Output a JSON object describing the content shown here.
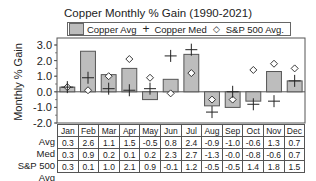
{
  "chart_data": {
    "type": "bar",
    "title": "Copper Monthly % Gain (1990-2021)",
    "xlabel": "",
    "ylabel": "Monthly % Gain",
    "ylim": [
      -2.0,
      3.0
    ],
    "yticks": [
      "3.0",
      "2.0",
      "1.0",
      "0.0",
      "-1.0",
      "-2.0"
    ],
    "grid": false,
    "legend_position": "top",
    "categories": [
      "Jan",
      "Feb",
      "Mar",
      "Apr",
      "May",
      "Jun",
      "Jul",
      "Aug",
      "Sep",
      "Oct",
      "Nov",
      "Dec"
    ],
    "series": [
      {
        "name": "Copper Avg",
        "type": "bar",
        "values": [
          0.3,
          2.6,
          1.1,
          1.5,
          -0.5,
          0.8,
          2.4,
          -0.9,
          -1.0,
          -0.6,
          1.3,
          0.7
        ]
      },
      {
        "name": "Copper Med",
        "type": "marker-plus",
        "values": [
          0.3,
          0.9,
          0.2,
          0.1,
          0.2,
          2.3,
          2.7,
          -1.3,
          -0.0,
          -0.8,
          -0.6,
          0.7
        ]
      },
      {
        "name": "S&P 500 Avg.",
        "type": "marker-diamond",
        "values": [
          0.3,
          0.1,
          1.0,
          2.1,
          0.9,
          -0.1,
          1.2,
          -0.5,
          -0.5,
          1.4,
          1.8,
          1.5
        ]
      }
    ],
    "table": {
      "row_labels": [
        "Avg",
        "Med",
        "S&P 500 Avg"
      ],
      "rows": [
        [
          "0.3",
          "2.6",
          "1.1",
          "1.5",
          "-0.5",
          "0.8",
          "2.4",
          "-0.9",
          "-1.0",
          "-0.6",
          "1.3",
          "0.7"
        ],
        [
          "0.3",
          "0.9",
          "0.2",
          "0.1",
          "0.2",
          "2.3",
          "2.7",
          "-1.3",
          "-0.0",
          "-0.8",
          "-0.6",
          "0.7"
        ],
        [
          "0.3",
          "0.1",
          "1.0",
          "2.1",
          "0.9",
          "-0.1",
          "1.2",
          "-0.5",
          "-0.5",
          "1.4",
          "1.8",
          "1.5"
        ]
      ]
    }
  },
  "legend": {
    "copper_avg": "Copper Avg",
    "copper_med": "Copper Med",
    "sp500_avg": "S&P 500 Avg.",
    "plus_symbol": "+",
    "diamond_symbol": "◇"
  },
  "colors": {
    "bar_fill": "#bdbdbd",
    "bar_stroke": "#555555",
    "axis": "#555555",
    "marker": "#222222"
  }
}
